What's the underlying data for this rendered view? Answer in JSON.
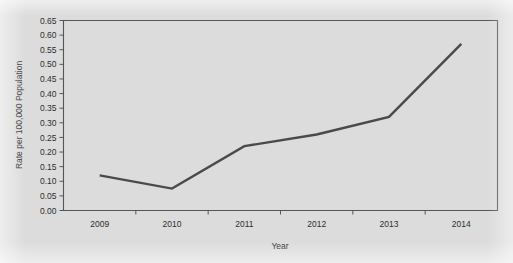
{
  "chart_data": {
    "type": "line",
    "title": "",
    "subtitle": "",
    "xlabel": "Year",
    "ylabel": "Rate per 100,000 Population",
    "categories": [
      "2009",
      "2010",
      "2011",
      "2012",
      "2013",
      "2014"
    ],
    "x": [
      2009,
      2010,
      2011,
      2012,
      2013,
      2014
    ],
    "series": [
      {
        "name": "Rate",
        "values": [
          0.12,
          0.075,
          0.22,
          0.26,
          0.32,
          0.57
        ],
        "color": "#4a4a4a"
      }
    ],
    "values": [
      0.12,
      0.075,
      0.22,
      0.26,
      0.32,
      0.57
    ],
    "ylim": [
      0.0,
      0.65
    ],
    "ytick_step": 0.05,
    "ytick_labels": [
      "0.00",
      "0.05",
      "0.10",
      "0.15",
      "0.20",
      "0.25",
      "0.30",
      "0.35",
      "0.40",
      "0.45",
      "0.50",
      "0.55",
      "0.60",
      "0.65"
    ],
    "ytick_values": [
      0.0,
      0.05,
      0.1,
      0.15,
      0.2,
      0.25,
      0.3,
      0.35,
      0.4,
      0.45,
      0.5,
      0.55,
      0.6,
      0.65
    ],
    "xtick_labels": [
      "2009",
      "2010",
      "2011",
      "2012",
      "2013",
      "2014"
    ],
    "grid": false,
    "legend": false,
    "legend_position": "none",
    "annotations": []
  },
  "colors": {
    "background": "#dcdcdc",
    "plot_background": "#dcdcdc",
    "line": "#4a4a4a",
    "axis": "#555555",
    "text": "#2e2e2e"
  }
}
